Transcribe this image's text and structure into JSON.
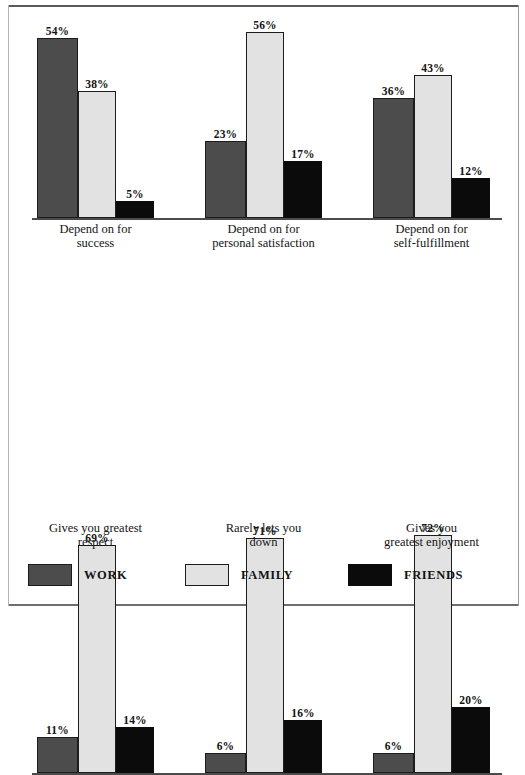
{
  "chart_data": {
    "type": "bar",
    "title": "",
    "subtitle": "",
    "xlabel": "",
    "ylabel": "",
    "ylim": [
      0,
      75
    ],
    "grid": false,
    "legend_position": "bottom",
    "value_suffix": "%",
    "orientation": "vertical",
    "grouping": "grouped",
    "panels": [
      {
        "name": "panel-top",
        "categories": [
          "Depend on for\nsuccess",
          "Depend on for\npersonal satisfaction",
          "Depend on for\nself-fulfillment"
        ],
        "series": [
          {
            "name": "WORK",
            "color": "#4c4c4c",
            "values": [
              54,
              23,
              36
            ]
          },
          {
            "name": "FAMILY",
            "color": "#e2e2e2",
            "values": [
              38,
              56,
              43
            ]
          },
          {
            "name": "FRIENDS",
            "color": "#0b0b0b",
            "values": [
              5,
              17,
              12
            ]
          }
        ],
        "labels": [
          [
            "54%",
            "38%",
            "5%"
          ],
          [
            "23%",
            "56%",
            "17%"
          ],
          [
            "36%",
            "43%",
            "12%"
          ]
        ]
      },
      {
        "name": "panel-bottom",
        "categories": [
          "Gives you greatest\nrespect",
          "Rarely lets you\ndown",
          "Gives you\ngreatest enjoyment"
        ],
        "series": [
          {
            "name": "WORK",
            "color": "#4c4c4c",
            "values": [
              11,
              6,
              6
            ]
          },
          {
            "name": "FAMILY",
            "color": "#e2e2e2",
            "values": [
              69,
              71,
              72
            ]
          },
          {
            "name": "FRIENDS",
            "color": "#0b0b0b",
            "values": [
              14,
              16,
              20
            ]
          }
        ],
        "labels": [
          [
            "11%",
            "69%",
            "14%"
          ],
          [
            "6%",
            "71%",
            "16%"
          ],
          [
            "6%",
            "72%",
            "20%"
          ]
        ]
      }
    ],
    "legend": [
      {
        "label": "WORK",
        "color": "#4c4c4c"
      },
      {
        "label": "FAMILY",
        "color": "#e2e2e2"
      },
      {
        "label": "FRIENDS",
        "color": "#0b0b0b"
      }
    ]
  }
}
